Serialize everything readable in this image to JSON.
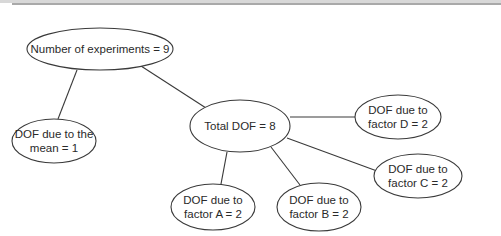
{
  "diagram": {
    "type": "tree",
    "root": "experiments",
    "nodes": [
      {
        "id": "experiments",
        "lines": [
          "Number of experiments = 9"
        ]
      },
      {
        "id": "mean",
        "lines": [
          "DOF due to the",
          "mean = 1"
        ]
      },
      {
        "id": "total",
        "lines": [
          "Total DOF = 8"
        ]
      },
      {
        "id": "factor_d",
        "lines": [
          "DOF due to",
          "factor D = 2"
        ]
      },
      {
        "id": "factor_c",
        "lines": [
          "DOF due to",
          "factor C = 2"
        ]
      },
      {
        "id": "factor_b",
        "lines": [
          "DOF due to",
          "factor B = 2"
        ]
      },
      {
        "id": "factor_a",
        "lines": [
          "DOF due to",
          "factor A = 2"
        ]
      }
    ],
    "edges": [
      {
        "from": "experiments",
        "to": "mean"
      },
      {
        "from": "experiments",
        "to": "total"
      },
      {
        "from": "total",
        "to": "factor_d"
      },
      {
        "from": "total",
        "to": "factor_c"
      },
      {
        "from": "total",
        "to": "factor_b"
      },
      {
        "from": "total",
        "to": "factor_a"
      }
    ],
    "colors": {
      "stroke": "#3a3a3a",
      "text": "#2a2a2a",
      "background": "#ffffff"
    }
  }
}
